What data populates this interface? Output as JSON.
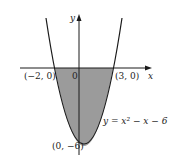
{
  "diagram": {
    "type": "function-graph",
    "equation_label": "y = x² − x − 6",
    "function": "y = x^2 - x - 6",
    "axes": {
      "x_label": "x",
      "y_label": "y",
      "origin_label": "0"
    },
    "points": [
      {
        "label": "(−2, 0)",
        "x": -2,
        "y": 0
      },
      {
        "label": "(3, 0)",
        "x": 3,
        "y": 0
      },
      {
        "label": "(0, −6)",
        "x": 0,
        "y": -6
      }
    ],
    "shaded_region": "between the x-axis and the parabola from x = −2 to x = 3",
    "colors": {
      "shade": "#8a8a8a",
      "curve": "#1a1a1a",
      "axis": "#1a1a1a"
    }
  }
}
